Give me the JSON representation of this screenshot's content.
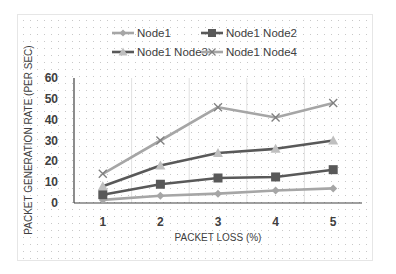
{
  "chart_data": {
    "type": "line",
    "title": "",
    "xlabel": "PACKET LOSS (%)",
    "ylabel": "PACKET GENERATION RATE (PER SEC)",
    "categories": [
      "1",
      "2",
      "3",
      "4",
      "5"
    ],
    "yticks": [
      "0",
      "10",
      "20",
      "30",
      "40",
      "50",
      "60"
    ],
    "ylim": [
      0,
      60
    ],
    "grid": "vertical gridlines between categories, dotted background",
    "legend_position": "top",
    "series": [
      {
        "name": "Node1",
        "marker": "diamond",
        "line_color": "#a6a6a6",
        "marker_color": "#a6a6a6",
        "values": [
          1.5,
          3.5,
          4.5,
          6,
          7
        ]
      },
      {
        "name": "Node1 Node2",
        "marker": "square",
        "line_color": "#595959",
        "marker_color": "#595959",
        "values": [
          4,
          9,
          12,
          12.5,
          16
        ]
      },
      {
        "name": "Node1 Node3",
        "marker": "triangle",
        "line_color": "#595959",
        "marker_color": "#bfbfbf",
        "values": [
          8,
          18,
          24,
          26,
          30
        ]
      },
      {
        "name": "Node1 Node4",
        "marker": "x",
        "line_color": "#a6a6a6",
        "marker_color": "#7f7f7f",
        "values": [
          14,
          30,
          46,
          41,
          48
        ]
      }
    ]
  },
  "legend": {
    "items": [
      {
        "label": "Node1"
      },
      {
        "label": "Node1 Node2"
      },
      {
        "label": "Node1 Node3"
      },
      {
        "label": "Node1 Node4"
      }
    ]
  },
  "axes": {
    "x_title": "PACKET LOSS (%)",
    "y_title": "PACKET GENERATION RATE (PER SEC)",
    "x_ticks": [
      "1",
      "2",
      "3",
      "4",
      "5"
    ],
    "y_ticks": [
      "0",
      "10",
      "20",
      "30",
      "40",
      "50",
      "60"
    ]
  }
}
